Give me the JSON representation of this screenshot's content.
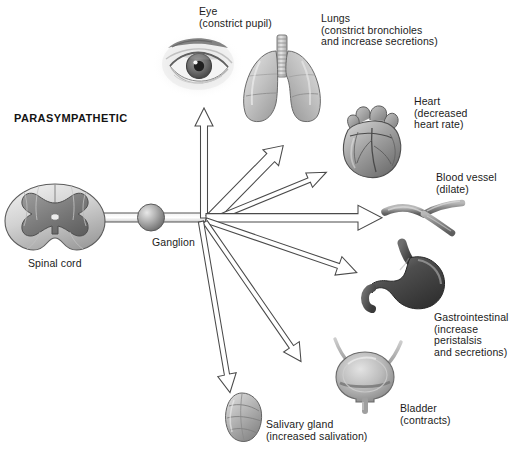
{
  "diagram": {
    "title": "PARASYMPATHETIC",
    "type": "autonomic nervous system schematic",
    "colors": {
      "outline": "#4a4a4a",
      "arrow_fill": "#ffffff",
      "organ_light": "#d9d9d9",
      "organ_mid": "#a8a8a8",
      "organ_dark": "#6e6e6e",
      "text": "#1b1b1b",
      "background": "#ffffff"
    },
    "source": {
      "label": "Spinal cord",
      "ganglion_label": "Ganglion"
    },
    "targets": [
      {
        "id": "eye",
        "organ": "eye",
        "name": "Eye",
        "effect": "(constrict pupil)",
        "label": "Eye\n(constrict pupil)"
      },
      {
        "id": "lungs",
        "organ": "lungs",
        "name": "Lungs",
        "effect": "(constrict bronchioles\nand increase secretions)",
        "label": "Lungs\n(constrict bronchioles\nand increase secretions)"
      },
      {
        "id": "heart",
        "organ": "heart",
        "name": "Heart",
        "effect": "(decreased\nheart rate)",
        "label": "Heart\n(decreased\nheart rate)"
      },
      {
        "id": "blood-vessel",
        "organ": "blood vessel",
        "name": "Blood vessel",
        "effect": "(dilate)",
        "label": "Blood vessel\n(dilate)"
      },
      {
        "id": "gastrointestinal",
        "organ": "stomach",
        "name": "Gastrointestinal",
        "effect": "(increase peristalsis\nand secretions)",
        "label": "Gastrointestinal\n(increase peristalsis\nand secretions)"
      },
      {
        "id": "bladder",
        "organ": "bladder",
        "name": "Bladder",
        "effect": "(contracts)",
        "label": "Bladder\n(contracts)"
      },
      {
        "id": "salivary-gland",
        "organ": "salivary gland",
        "name": "Salivary gland",
        "effect": "(increased salivation)",
        "label": "Salivary gland\n(increased salivation)"
      }
    ]
  }
}
